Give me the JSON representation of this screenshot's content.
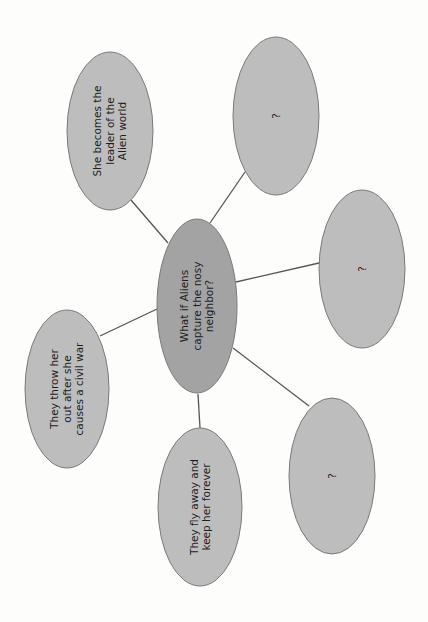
{
  "diagram": {
    "type": "mind-map",
    "orientation": "rotated-90-ccw",
    "colors": {
      "background": "#fdfdfb",
      "center_fill": "#a3a3a3",
      "node_fill": "#bdbdbd",
      "stroke": "#7a7a7a",
      "line": "#555555",
      "text": "#1e1e1e"
    },
    "center": {
      "label": "What if Aliens\ncapture the nosy\nneighbor?",
      "cx": 197,
      "cy": 306,
      "rx": 40,
      "ry": 87
    },
    "nodes": [
      {
        "id": "top-left",
        "label": "She becomes the\nleader of the\nAlien world",
        "cx": 110,
        "cy": 131,
        "rx": 43,
        "ry": 79,
        "line": [
          131,
          200,
          168,
          243
        ]
      },
      {
        "id": "top-right",
        "label": "?",
        "cx": 276,
        "cy": 116,
        "rx": 43,
        "ry": 79,
        "line": [
          245,
          172,
          210,
          223
        ]
      },
      {
        "id": "right",
        "label": "?",
        "cx": 362,
        "cy": 269,
        "rx": 43,
        "ry": 79,
        "line": [
          319,
          263,
          236,
          282
        ]
      },
      {
        "id": "bottom-right",
        "label": "?",
        "cx": 332,
        "cy": 476,
        "rx": 43,
        "ry": 78,
        "line": [
          309,
          406,
          233,
          348
        ]
      },
      {
        "id": "bottom",
        "label": "They fly away and\nkeep her forever",
        "cx": 200,
        "cy": 507,
        "rx": 42,
        "ry": 79,
        "line": [
          200,
          428,
          198,
          394
        ]
      },
      {
        "id": "left",
        "label": "They throw her\nout after she\ncauses a civil war",
        "cx": 67,
        "cy": 389,
        "rx": 42,
        "ry": 79,
        "line": [
          100,
          336,
          157,
          309
        ]
      }
    ]
  }
}
